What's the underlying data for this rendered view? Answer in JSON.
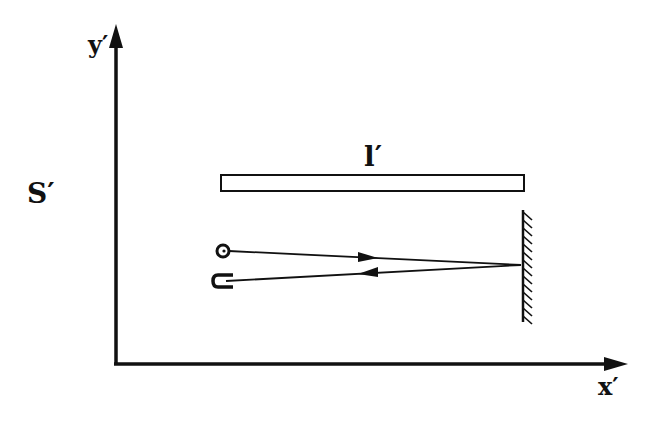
{
  "labels": {
    "frame": "S′",
    "y_axis": "y′",
    "x_axis": "x′",
    "rod_length": "l′"
  },
  "colors": {
    "ink": "#111111",
    "background": "#ffffff"
  }
}
